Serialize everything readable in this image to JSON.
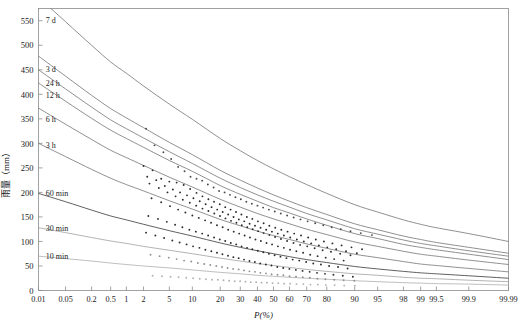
{
  "chart_data": {
    "type": "line",
    "title": "",
    "xlabel": "P(%)",
    "ylabel": "雨量（mm）",
    "xscale": "probability",
    "yscale": "linear",
    "ylim": [
      0,
      575
    ],
    "grid": false,
    "legend": "inline-curve-labels",
    "xticklabels": [
      "0.01",
      "0.05",
      "0.2",
      "0.5",
      "1",
      "2",
      "5",
      "10",
      "20",
      "30",
      "40",
      "50",
      "60",
      "70",
      "80",
      "90",
      "95",
      "98",
      "99",
      "99.5",
      "99.9",
      "99.99"
    ],
    "xtickvalues": [
      0.01,
      0.05,
      0.2,
      0.5,
      1,
      2,
      5,
      10,
      20,
      30,
      40,
      50,
      60,
      70,
      80,
      90,
      95,
      98,
      99,
      99.5,
      99.9,
      99.99
    ],
    "yticklabels": [
      "0",
      "50",
      "100",
      "150",
      "200",
      "250",
      "300",
      "350",
      "400",
      "450",
      "500",
      "550"
    ],
    "ytickvalues": [
      0,
      50,
      100,
      150,
      200,
      250,
      300,
      350,
      400,
      450,
      500,
      550
    ],
    "series": [
      {
        "name": "7 d",
        "label": "7 d",
        "color": "#6b6b6b",
        "label_x": 0.013,
        "label_y": 552,
        "x": [
          0.01,
          0.05,
          0.2,
          0.5,
          1,
          2,
          5,
          10,
          20,
          30,
          40,
          50,
          60,
          70,
          80,
          90,
          95,
          98,
          99,
          99.5,
          99.9,
          99.99
        ],
        "y": [
          598,
          548,
          500,
          466,
          443,
          417,
          380,
          349,
          310,
          285,
          265,
          248,
          232,
          216,
          198,
          175,
          160,
          144,
          135,
          128,
          116,
          100
        ]
      },
      {
        "name": "3 d",
        "label": "3 d",
        "color": "#6b6b6b",
        "label_x": 0.013,
        "label_y": 452,
        "x": [
          0.01,
          0.05,
          0.2,
          0.5,
          1,
          2,
          5,
          10,
          20,
          30,
          40,
          50,
          60,
          70,
          80,
          90,
          95,
          98,
          99,
          99.5,
          99.9,
          99.99
        ],
        "y": [
          478,
          437,
          398,
          371,
          352,
          332,
          302,
          277,
          245,
          225,
          209,
          195,
          182,
          169,
          155,
          136,
          124,
          111,
          104,
          98,
          88,
          76
        ]
      },
      {
        "name": "24 h",
        "label": "24 h",
        "color": "#6b6b6b",
        "label_x": 0.013,
        "label_y": 424,
        "x": [
          0.01,
          0.05,
          0.2,
          0.5,
          1,
          2,
          5,
          10,
          20,
          30,
          40,
          50,
          60,
          70,
          80,
          90,
          95,
          98,
          99,
          99.5,
          99.9,
          99.99
        ],
        "y": [
          450,
          411,
          374,
          348,
          330,
          311,
          283,
          259,
          229,
          210,
          195,
          182,
          170,
          157,
          144,
          126,
          115,
          103,
          96,
          91,
          81,
          70
        ]
      },
      {
        "name": "12 h",
        "label": "12 h",
        "color": "#6b6b6b",
        "label_x": 0.013,
        "label_y": 399,
        "x": [
          0.01,
          0.05,
          0.2,
          0.5,
          1,
          2,
          5,
          10,
          20,
          30,
          40,
          50,
          60,
          70,
          80,
          90,
          95,
          98,
          99,
          99.5,
          99.9,
          99.99
        ],
        "y": [
          423,
          386,
          351,
          327,
          310,
          292,
          265,
          243,
          214,
          196,
          182,
          169,
          158,
          146,
          133,
          116,
          106,
          94,
          88,
          83,
          74,
          63
        ]
      },
      {
        "name": "6 h",
        "label": "6 h",
        "color": "#6b6b6b",
        "label_x": 0.013,
        "label_y": 350,
        "x": [
          0.01,
          0.05,
          0.2,
          0.5,
          1,
          2,
          5,
          10,
          20,
          30,
          40,
          50,
          60,
          70,
          80,
          90,
          95,
          98,
          99,
          99.5,
          99.9,
          99.99
        ],
        "y": [
          372,
          339,
          308,
          286,
          271,
          255,
          231,
          211,
          186,
          170,
          157,
          146,
          136,
          125,
          114,
          99,
          90,
          80,
          74,
          70,
          62,
          53
        ]
      },
      {
        "name": "3 h",
        "label": "3 h",
        "color": "#6b6b6b",
        "label_x": 0.013,
        "label_y": 297,
        "x": [
          0.01,
          0.05,
          0.2,
          0.5,
          1,
          2,
          5,
          10,
          20,
          30,
          40,
          50,
          60,
          70,
          80,
          90,
          95,
          98,
          99,
          99.5,
          99.9,
          99.99
        ],
        "y": [
          300,
          273,
          247,
          229,
          216,
          203,
          183,
          166,
          145,
          132,
          121,
          112,
          104,
          95,
          86,
          74,
          67,
          59,
          54,
          51,
          45,
          38
        ]
      },
      {
        "name": "60 min",
        "label": "60 min",
        "color": "#2b2b2b",
        "label_x": 0.013,
        "label_y": 198,
        "x": [
          0.01,
          0.05,
          0.2,
          0.5,
          1,
          2,
          5,
          10,
          20,
          30,
          40,
          50,
          60,
          70,
          80,
          90,
          95,
          98,
          99,
          99.5,
          99.9,
          99.99
        ],
        "y": [
          198,
          181,
          164,
          152,
          144,
          135,
          122,
          111,
          97,
          88,
          81,
          75,
          69,
          63,
          57,
          49,
          44,
          39,
          36,
          34,
          30,
          25
        ]
      },
      {
        "name": "30 min",
        "label": "30 min",
        "color": "#9a9a9a",
        "label_x": 0.013,
        "label_y": 128,
        "x": [
          0.01,
          0.05,
          0.2,
          0.5,
          1,
          2,
          5,
          10,
          20,
          30,
          40,
          50,
          60,
          70,
          80,
          90,
          95,
          98,
          99,
          99.5,
          99.9,
          99.99
        ],
        "y": [
          128,
          118,
          108,
          101,
          96,
          90,
          82,
          75,
          66,
          60,
          55,
          51,
          47,
          43,
          39,
          34,
          31,
          27,
          25,
          24,
          21,
          18
        ]
      },
      {
        "name": "10 min",
        "label": "10 min",
        "color": "#a8a8a8",
        "label_x": 0.013,
        "label_y": 70,
        "x": [
          0.01,
          0.05,
          0.2,
          0.5,
          1,
          2,
          5,
          10,
          20,
          30,
          40,
          50,
          60,
          70,
          80,
          90,
          95,
          98,
          99,
          99.5,
          99.9,
          99.99
        ],
        "y": [
          70,
          65,
          60,
          56,
          53,
          50,
          46,
          42,
          37,
          34,
          31,
          29,
          27,
          25,
          23,
          20,
          18,
          16,
          15,
          14,
          13,
          11
        ]
      }
    ],
    "scatter": [
      {
        "series": "7 d",
        "color": "#4a4a4a",
        "x": [
          2.2,
          3.0,
          4.1,
          5.3,
          6.6,
          8.0,
          9.5,
          11.2,
          13.0,
          15.0,
          17.2,
          19.5,
          22.0,
          24.6,
          27.4,
          30.3,
          33.4,
          36.6,
          40.0,
          43.5,
          47.1,
          50.8,
          54.6,
          58.5,
          62.5,
          66.5,
          70.5,
          74.5,
          78.4,
          82.1,
          85.6,
          88.8,
          91.6,
          94.0
        ],
        "y": [
          330,
          296,
          282,
          268,
          252,
          243,
          232,
          228,
          224,
          216,
          210,
          203,
          200,
          195,
          190,
          186,
          181,
          177,
          173,
          169,
          165,
          161,
          157,
          153,
          149,
          145,
          141,
          137,
          133,
          129,
          125,
          121,
          117,
          113
        ]
      },
      {
        "series": "3 d",
        "color": "#2b2b2b",
        "x": [
          2.0,
          2.8,
          3.8,
          5.0,
          6.3,
          7.8,
          9.4,
          11.2,
          13.1,
          15.2,
          17.4,
          19.8,
          22.3,
          24.9,
          27.7,
          30.6,
          33.7,
          36.9,
          40.3,
          43.8,
          47.4,
          51.1,
          54.9,
          58.8,
          62.8,
          66.8,
          70.8,
          74.8,
          78.7,
          82.4,
          85.9,
          89.1,
          91.9
        ],
        "y": [
          254,
          245,
          228,
          222,
          220,
          215,
          207,
          199,
          192,
          186,
          181,
          176,
          170,
          165,
          160,
          155,
          150,
          146,
          141,
          137,
          132,
          128,
          124,
          120,
          116,
          112,
          108,
          104,
          100,
          96,
          92,
          88,
          84
        ]
      },
      {
        "series": "24 h",
        "color": "#2b2b2b",
        "x": [
          2.3,
          3.2,
          4.3,
          5.6,
          7.0,
          8.6,
          10.3,
          12.2,
          14.2,
          16.4,
          18.7,
          21.1,
          23.7,
          26.4,
          29.2,
          32.2,
          35.3,
          38.5,
          41.9,
          45.4,
          49.0,
          52.7,
          56.5,
          60.4,
          64.4,
          68.4,
          72.4,
          76.3,
          80.2,
          83.9,
          87.4,
          90.6
        ],
        "y": [
          232,
          225,
          213,
          206,
          200,
          194,
          188,
          182,
          176,
          170,
          165,
          160,
          155,
          150,
          145,
          141,
          136,
          132,
          128,
          124,
          120,
          116,
          112,
          108,
          104,
          100,
          96,
          92,
          88,
          84,
          80,
          76
        ]
      },
      {
        "series": "12 h",
        "color": "#2b2b2b",
        "x": [
          2.5,
          3.5,
          4.7,
          6.1,
          7.6,
          9.3,
          11.1,
          13.1,
          15.2,
          17.5,
          19.9,
          22.4,
          25.1,
          27.9,
          30.8,
          33.9,
          37.1,
          40.4,
          43.8,
          47.4,
          51.0,
          54.7,
          58.5,
          62.4,
          66.3,
          70.3,
          74.2,
          78.1,
          81.8,
          85.4,
          88.8
        ],
        "y": [
          218,
          209,
          200,
          192,
          185,
          179,
          173,
          167,
          162,
          157,
          152,
          147,
          142,
          138,
          133,
          129,
          125,
          121,
          117,
          113,
          109,
          105,
          101,
          97,
          93,
          90,
          86,
          82,
          79,
          75,
          72
        ]
      },
      {
        "series": "6 h",
        "color": "#2b2b2b",
        "x": [
          2.7,
          3.8,
          5.1,
          6.6,
          8.2,
          10.0,
          11.9,
          14.0,
          16.2,
          18.6,
          21.1,
          23.7,
          26.5,
          29.4,
          32.4,
          35.5,
          38.8,
          42.1,
          45.6,
          49.1,
          52.8,
          56.5,
          60.3,
          64.1,
          68.0,
          71.9,
          75.7,
          79.5,
          83.1,
          86.6
        ],
        "y": [
          188,
          180,
          172,
          165,
          159,
          153,
          148,
          143,
          138,
          133,
          129,
          124,
          120,
          116,
          112,
          108,
          104,
          101,
          97,
          94,
          90,
          87,
          83,
          80,
          77,
          73,
          70,
          67,
          64,
          61
        ]
      },
      {
        "series": "3 h",
        "color": "#2b2b2b",
        "x": [
          2.4,
          3.4,
          4.6,
          6.0,
          7.5,
          9.2,
          11.0,
          13.0,
          15.1,
          17.4,
          19.8,
          22.3,
          25.0,
          27.8,
          30.7,
          33.8,
          36.9,
          40.2,
          43.6,
          47.1,
          50.7,
          54.4,
          58.1,
          61.9,
          65.8,
          69.7,
          73.5,
          77.3,
          81.0,
          84.6,
          87.9
        ],
        "y": [
          152,
          146,
          140,
          134,
          129,
          124,
          120,
          116,
          112,
          108,
          104,
          101,
          97,
          94,
          90,
          87,
          84,
          81,
          78,
          75,
          72,
          69,
          66,
          63,
          61,
          58,
          55,
          53,
          50,
          48,
          45
        ]
      },
      {
        "series": "60 min",
        "color": "#2b2b2b",
        "x": [
          2.2,
          3.1,
          4.2,
          5.5,
          6.9,
          8.5,
          10.2,
          12.1,
          14.1,
          16.3,
          18.6,
          21.0,
          23.6,
          26.3,
          29.1,
          32.1,
          35.2,
          38.4,
          41.7,
          45.2,
          48.7,
          52.4,
          56.1,
          59.9,
          63.8,
          67.7,
          71.6,
          75.4,
          79.2,
          82.8,
          86.3,
          89.5
        ],
        "y": [
          118,
          112,
          107,
          102,
          98,
          94,
          90,
          87,
          83,
          80,
          77,
          74,
          71,
          68,
          66,
          63,
          60,
          58,
          55,
          53,
          51,
          48,
          46,
          44,
          42,
          40,
          38,
          36,
          34,
          32,
          30,
          28
        ]
      },
      {
        "series": "30 min",
        "color": "#8f8f8f",
        "x": [
          2.6,
          3.6,
          4.9,
          6.3,
          7.9,
          9.7,
          11.6,
          13.7,
          15.9,
          18.3,
          20.8,
          23.4,
          26.2,
          29.1,
          32.1,
          35.2,
          38.5,
          41.8,
          45.3,
          48.8,
          52.5,
          56.2,
          60.0,
          63.9,
          67.8,
          71.7,
          75.6,
          79.4,
          83.1,
          86.6,
          89.9
        ],
        "y": [
          73,
          70,
          67,
          64,
          61,
          59,
          56,
          54,
          52,
          50,
          48,
          46,
          44,
          43,
          41,
          39,
          38,
          36,
          35,
          33,
          32,
          31,
          29,
          28,
          27,
          26,
          24,
          23,
          22,
          21,
          20
        ]
      },
      {
        "series": "10 min",
        "color": "#b0b0b0",
        "x": [
          2.8,
          3.9,
          5.2,
          6.7,
          8.4,
          10.2,
          12.2,
          14.3,
          16.6,
          19.0,
          21.5,
          24.2,
          27.0,
          29.9,
          32.9,
          36.0,
          39.2,
          42.5,
          45.9,
          49.4,
          53.0,
          56.7,
          60.4,
          64.2,
          68.1,
          72.0,
          75.8,
          79.6,
          83.3,
          86.8,
          90.1
        ],
        "y": [
          30,
          29,
          28,
          27,
          26,
          25,
          24,
          23,
          22,
          22,
          21,
          20,
          19,
          19,
          18,
          17,
          17,
          16,
          16,
          15,
          15,
          14,
          14,
          13,
          13,
          12,
          12,
          11,
          11,
          10,
          10
        ]
      }
    ]
  },
  "axis": {
    "x_title": "P(%)",
    "y_title": "雨量（mm）"
  }
}
